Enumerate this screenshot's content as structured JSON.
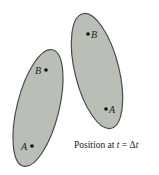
{
  "colors": {
    "fill": "#b9bfb6",
    "stroke": "#4a4a4a",
    "dot": "#111111",
    "background": "#ffffff"
  },
  "bodies": [
    {
      "name": "initial-body",
      "points": [
        {
          "label": "B",
          "label_side": "left"
        },
        {
          "label": "A",
          "label_side": "left"
        }
      ]
    },
    {
      "name": "displaced-body",
      "points": [
        {
          "label": "B",
          "label_side": "right"
        },
        {
          "label": "A",
          "label_side": "right"
        }
      ]
    }
  ],
  "caption": {
    "prefix": "Position at ",
    "var": "t",
    "equals": " = ",
    "delta": "Δ",
    "delta_var": "t"
  }
}
